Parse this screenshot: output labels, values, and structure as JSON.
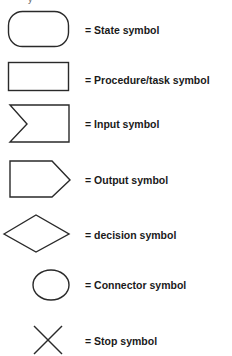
{
  "diagram": {
    "title_fragment": "y",
    "legend": [
      {
        "shape": "rounded-rectangle",
        "label": "= State symbol"
      },
      {
        "shape": "rectangle",
        "label": "= Procedure/task symbol"
      },
      {
        "shape": "notched-rectangle",
        "label": "= Input symbol"
      },
      {
        "shape": "pentagon-arrow",
        "label": "= Output symbol"
      },
      {
        "shape": "diamond",
        "label": "= decision symbol"
      },
      {
        "shape": "circle",
        "label": "= Connector symbol"
      },
      {
        "shape": "x-cross",
        "label": "= Stop symbol"
      }
    ],
    "stroke_color": "#2a2a2a",
    "text_color": "#1a1a1a"
  }
}
